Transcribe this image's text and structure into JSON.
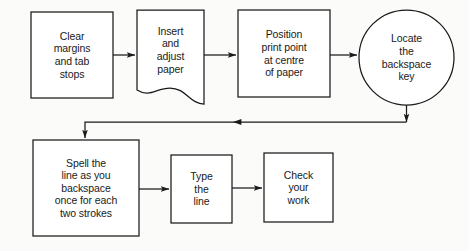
{
  "diagram": {
    "stroke_color": "#1a1a1a",
    "fill_color": "#ffffff",
    "background_color": "#fbfbf9",
    "nodes": [
      {
        "id": "clear-margins",
        "shape": "rectangle",
        "label": "Clear\nmargins\nand tab\nstops"
      },
      {
        "id": "insert-paper",
        "shape": "document",
        "label": "Insert\nand\nadjust\npaper"
      },
      {
        "id": "position-print",
        "shape": "rectangle",
        "label": "Position\nprint point\nat centre\nof paper"
      },
      {
        "id": "locate-key",
        "shape": "circle",
        "label": "Locate\nthe\nbackspace\nkey"
      },
      {
        "id": "spell-line",
        "shape": "rectangle",
        "label": "Spell the\nline as you\nbackspace\nonce for each\ntwo strokes"
      },
      {
        "id": "type-line",
        "shape": "rectangle",
        "label": "Type\nthe\nline"
      },
      {
        "id": "check-work",
        "shape": "rectangle",
        "label": "Check\nyour\nwork"
      }
    ],
    "edges": [
      {
        "id": "clear-to-insert",
        "from": "clear-margins",
        "to": "insert-paper",
        "label": ""
      },
      {
        "id": "insert-to-position",
        "from": "insert-paper",
        "to": "position-print",
        "label": ""
      },
      {
        "id": "position-to-locate",
        "from": "position-print",
        "to": "locate-key",
        "label": ""
      },
      {
        "id": "locate-to-spell",
        "from": "locate-key",
        "to": "spell-line",
        "label": ""
      },
      {
        "id": "spell-to-type",
        "from": "spell-line",
        "to": "type-line",
        "label": ""
      },
      {
        "id": "type-to-check",
        "from": "type-line",
        "to": "check-work",
        "label": ""
      }
    ]
  }
}
